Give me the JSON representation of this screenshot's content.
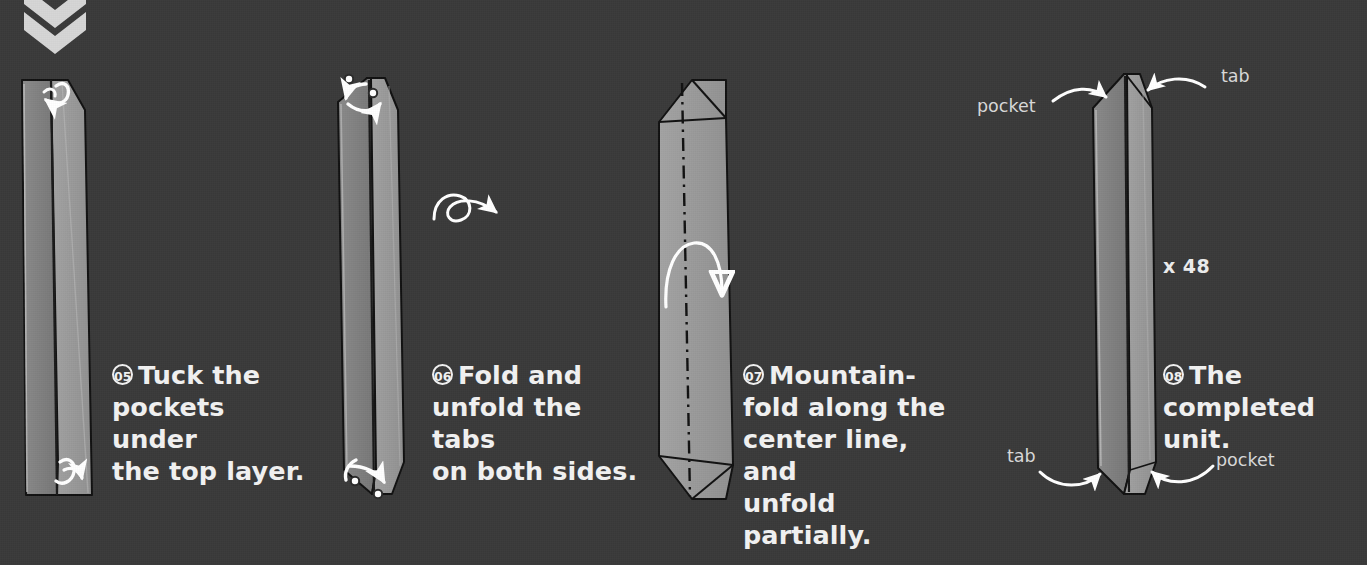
{
  "page": {
    "background_color": "#3a3a3a",
    "paper_front_color": "#9a9a9a",
    "paper_back_color": "#7d7d7d",
    "paper_edge_color": "#b5b5b5",
    "line_color": "#111111",
    "arrow_color": "#ffffff",
    "text_color": "#f2f2f2",
    "label_text_color": "#d9d9d9",
    "width": 1367,
    "height": 565
  },
  "top_marker": {
    "icon": "double-chevron-down-icon",
    "count": 2
  },
  "steps": [
    {
      "id": "step-05",
      "number": "05",
      "text": "Tuck the\npockets under\nthe top layer.",
      "diagram": "narrow-strip-with-tuck-arrows",
      "arrows": [
        "tuck-arrow-top-left",
        "tuck-arrow-bottom-right"
      ]
    },
    {
      "id": "step-06",
      "number": "06",
      "text": "Fold and\nunfold the tabs\non both sides.",
      "diagram": "pointed-strip-with-fold-unfold-arrows",
      "arrows": [
        "fold-unfold-arrow-top",
        "fold-unfold-arrow-bottom"
      ],
      "symbol": "turn-over-symbol"
    },
    {
      "id": "step-07",
      "number": "07",
      "text": "Mountain-\nfold along the\ncenter line, and\nunfold partially.",
      "diagram": "wide-strip-with-center-mountain-line",
      "arrows": [
        "mountain-fold-arrow"
      ],
      "fold_line": "dash-dot-center-line"
    },
    {
      "id": "step-08",
      "number": "08",
      "text": "The\ncompleted unit.",
      "diagram": "completed-unit",
      "quantity": "x 48",
      "callouts": [
        {
          "label": "pocket",
          "position": "top-left"
        },
        {
          "label": "tab",
          "position": "top-right"
        },
        {
          "label": "tab",
          "position": "bottom-left"
        },
        {
          "label": "pocket",
          "position": "bottom-right"
        }
      ]
    }
  ]
}
